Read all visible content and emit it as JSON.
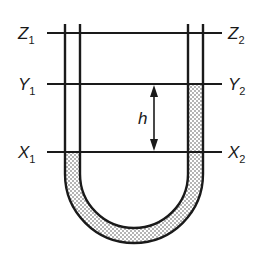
{
  "diagram": {
    "type": "U-tube manometer",
    "levels": [
      {
        "left": "Z",
        "left_sub": "1",
        "right": "Z",
        "right_sub": "2"
      },
      {
        "left": "Y",
        "left_sub": "1",
        "right": "Y",
        "right_sub": "2"
      },
      {
        "left": "X",
        "left_sub": "1",
        "right": "X",
        "right_sub": "2"
      }
    ],
    "height_label": "h",
    "colors": {
      "stroke": "#1a1a1a",
      "fill_dots": "#555555",
      "background": "#ffffff"
    }
  }
}
